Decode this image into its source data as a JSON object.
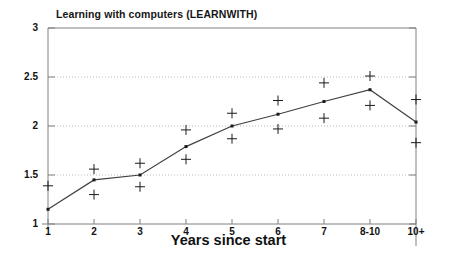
{
  "chart_data": {
    "type": "line",
    "title": "Learning with computers (LEARNWITH)",
    "xlabel": "Years since start",
    "ylabel": "",
    "categories": [
      "1",
      "2",
      "3",
      "4",
      "5",
      "6",
      "7",
      "8-10",
      "10+"
    ],
    "ylim": [
      1,
      3
    ],
    "yticks": [
      "1",
      "1.5",
      "2",
      "2.5",
      "3"
    ],
    "ytick_values": [
      1,
      1.5,
      2,
      2.5,
      3
    ],
    "grid": "horizontal dotted gridlines at 1.5, 2, 2.5",
    "legend": "none",
    "series": [
      {
        "name": "mean",
        "marker": "filled-square-with-line",
        "values": [
          1.15,
          1.45,
          1.5,
          1.79,
          2.0,
          2.12,
          2.25,
          2.37,
          2.04
        ]
      },
      {
        "name": "upper confidence limit",
        "marker": "plus",
        "values": [
          1.39,
          1.56,
          1.62,
          1.96,
          2.13,
          2.26,
          2.44,
          2.51,
          2.27
        ]
      },
      {
        "name": "lower confidence limit",
        "marker": "plus",
        "values": [
          null,
          1.3,
          1.38,
          1.66,
          1.87,
          1.97,
          2.08,
          2.21,
          1.83
        ]
      }
    ],
    "colors": {
      "line": "#404040",
      "marker": "#1a1a1a",
      "grid": "#b9b9b9",
      "axis": "#808080",
      "background": "#ffffff"
    }
  }
}
